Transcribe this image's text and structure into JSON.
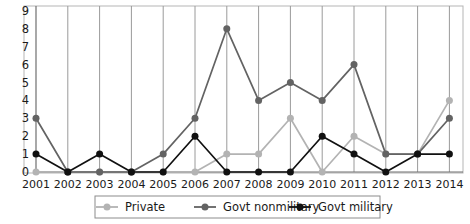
{
  "chart_data": {
    "type": "line",
    "title": "",
    "xlabel": "",
    "ylabel": "",
    "categories": [
      "2001",
      "2002",
      "2003",
      "2004",
      "2005",
      "2006",
      "2007",
      "2008",
      "2009",
      "2010",
      "2011",
      "2012",
      "2013",
      "2014"
    ],
    "x": [
      2001,
      2002,
      2003,
      2004,
      2005,
      2006,
      2007,
      2008,
      2009,
      2010,
      2011,
      2012,
      2013,
      2014
    ],
    "ylim": [
      0,
      9
    ],
    "xlim": [
      2001,
      2014
    ],
    "yticks": [
      0,
      1,
      2,
      3,
      4,
      5,
      6,
      7,
      8,
      9
    ],
    "ytick_labels": [
      "0",
      "1",
      "2",
      "3",
      "4",
      "5",
      "6",
      "7",
      "8",
      "9"
    ],
    "grid": "vertical-only",
    "legend_position": "bottom-center",
    "series": [
      {
        "name": "Private",
        "color": "#b3b3b3",
        "marker": "circle",
        "values": [
          0,
          0,
          0,
          0,
          0,
          0,
          1,
          1,
          3,
          0,
          2,
          1,
          1,
          4
        ]
      },
      {
        "name": "Govt nonmilitary",
        "color": "#636363",
        "marker": "circle",
        "values": [
          3,
          0,
          0,
          0,
          1,
          3,
          8,
          4,
          5,
          4,
          6,
          1,
          1,
          3
        ]
      },
      {
        "name": "Govt military",
        "color": "#111111",
        "marker": "circle",
        "values": [
          1,
          0,
          1,
          0,
          0,
          2,
          0,
          0,
          0,
          2,
          1,
          0,
          1,
          1
        ]
      }
    ]
  },
  "legend": {
    "items": [
      {
        "label": "Private",
        "color": "#b3b3b3"
      },
      {
        "label": "Govt nonmilitary",
        "color": "#636363"
      },
      {
        "label": "Govt military",
        "color": "#111111"
      }
    ]
  },
  "axes": {
    "y_labels": [
      "9",
      "8",
      "7",
      "6",
      "5",
      "4",
      "3",
      "2",
      "1",
      "0"
    ],
    "x_labels": [
      "2001",
      "2002",
      "2003",
      "2004",
      "2005",
      "2006",
      "2007",
      "2008",
      "2009",
      "2010",
      "2011",
      "2012",
      "2013",
      "2014"
    ]
  }
}
